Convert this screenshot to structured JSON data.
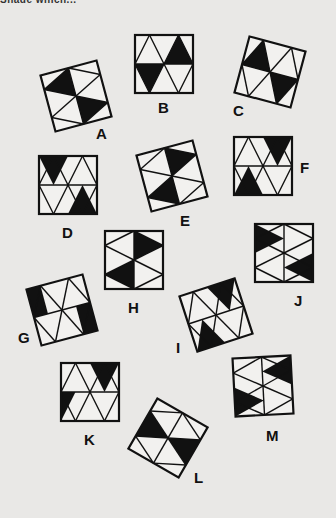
{
  "header": {
    "fragment": "Shade which..."
  },
  "style": {
    "ink": "#111111",
    "paper": "#e9e8e6",
    "stroke_width": 2.2,
    "inner_stroke_width": 1.4
  },
  "patterns": {
    "H": {
      "lines": [
        [
          0,
          0.5,
          1,
          0.5
        ],
        [
          0,
          0.5,
          0.25,
          0
        ],
        [
          0.25,
          0,
          0.5,
          0.5
        ],
        [
          0.5,
          0.5,
          0.75,
          0
        ],
        [
          0.75,
          0,
          1,
          0.5
        ],
        [
          0,
          0.5,
          0.25,
          1
        ],
        [
          0.25,
          1,
          0.5,
          0.5
        ],
        [
          0.5,
          0.5,
          0.75,
          1
        ],
        [
          0.75,
          1,
          1,
          0.5
        ]
      ]
    },
    "V": {
      "lines": [
        [
          0.5,
          0,
          0.5,
          1
        ],
        [
          0.5,
          0,
          0,
          0.25
        ],
        [
          0,
          0.25,
          0.5,
          0.5
        ],
        [
          0.5,
          0.5,
          0,
          0.75
        ],
        [
          0,
          0.75,
          0.5,
          1
        ],
        [
          0.5,
          0,
          1,
          0.25
        ],
        [
          1,
          0.25,
          0.5,
          0.5
        ],
        [
          0.5,
          0.5,
          1,
          0.75
        ],
        [
          1,
          0.75,
          0.5,
          1
        ]
      ]
    }
  },
  "figures": [
    {
      "label": "A",
      "cx": 76,
      "cy": 96,
      "size": 58,
      "rot": -15,
      "pattern": "V",
      "fills": [
        [
          [
            0.5,
            0
          ],
          [
            0,
            0.25
          ],
          [
            0.5,
            0.5
          ]
        ],
        [
          [
            0.5,
            0.5
          ],
          [
            1,
            0.75
          ],
          [
            0.5,
            1
          ]
        ]
      ],
      "label_x": 96,
      "label_y": 126
    },
    {
      "label": "B",
      "cx": 164,
      "cy": 64,
      "size": 58,
      "rot": 0,
      "pattern": "H",
      "fills": [
        [
          [
            0.5,
            0.5
          ],
          [
            0.75,
            0
          ],
          [
            1,
            0.5
          ]
        ],
        [
          [
            0,
            0.5
          ],
          [
            0.25,
            1
          ],
          [
            0.5,
            0.5
          ]
        ]
      ],
      "label_x": 158,
      "label_y": 100
    },
    {
      "label": "C",
      "cx": 270,
      "cy": 72,
      "size": 58,
      "rot": 15,
      "pattern": "H",
      "fills": [
        [
          [
            0,
            0.5
          ],
          [
            0.25,
            0
          ],
          [
            0.5,
            0.5
          ]
        ],
        [
          [
            0.5,
            0.5
          ],
          [
            0.75,
            1
          ],
          [
            1,
            0.5
          ]
        ]
      ],
      "label_x": 233,
      "label_y": 103
    },
    {
      "label": "D",
      "cx": 68,
      "cy": 185,
      "size": 58,
      "rot": 0,
      "pattern": "H",
      "fills": [
        [
          [
            0,
            0
          ],
          [
            0.5,
            0
          ],
          [
            0.25,
            0.5
          ]
        ],
        [
          [
            0.5,
            1
          ],
          [
            1,
            1
          ],
          [
            0.75,
            0.5
          ]
        ]
      ],
      "label_x": 62,
      "label_y": 225
    },
    {
      "label": "E",
      "cx": 172,
      "cy": 176,
      "size": 58,
      "rot": -15,
      "pattern": "V",
      "fills": [
        [
          [
            0.5,
            0
          ],
          [
            1,
            0.25
          ],
          [
            0.5,
            0.5
          ]
        ],
        [
          [
            0.5,
            0.5
          ],
          [
            0,
            0.75
          ],
          [
            0.5,
            1
          ]
        ]
      ],
      "label_x": 180,
      "label_y": 213
    },
    {
      "label": "F",
      "cx": 263,
      "cy": 166,
      "size": 58,
      "rot": 0,
      "pattern": "H",
      "fills": [
        [
          [
            0.5,
            0
          ],
          [
            1,
            0
          ],
          [
            0.75,
            0.5
          ]
        ],
        [
          [
            0,
            1
          ],
          [
            0.5,
            1
          ],
          [
            0.25,
            0.5
          ]
        ]
      ],
      "label_x": 300,
      "label_y": 160
    },
    {
      "label": "G",
      "cx": 62,
      "cy": 310,
      "size": 58,
      "rot": -15,
      "pattern": "H",
      "fills": [
        [
          [
            0,
            0
          ],
          [
            0.25,
            0
          ],
          [
            0.25,
            0.5
          ],
          [
            0,
            0.5
          ]
        ],
        [
          [
            0.75,
            0.5
          ],
          [
            1,
            0.5
          ],
          [
            1,
            1
          ],
          [
            0.75,
            1
          ]
        ]
      ],
      "fill_mode": "custom",
      "label_x": 18,
      "label_y": 330
    },
    {
      "label": "H",
      "cx": 134,
      "cy": 260,
      "size": 58,
      "rot": 0,
      "pattern": "V",
      "fills": [
        [
          [
            0.5,
            0
          ],
          [
            1,
            0.25
          ],
          [
            0.5,
            0.5
          ]
        ],
        [
          [
            0.5,
            0.5
          ],
          [
            0,
            0.75
          ],
          [
            0.5,
            1
          ]
        ]
      ],
      "label_x": 128,
      "label_y": 300
    },
    {
      "label": "I",
      "cx": 216,
      "cy": 315,
      "size": 58,
      "rot": -18,
      "pattern": "H",
      "fills": [
        [
          [
            0.5,
            0
          ],
          [
            1,
            0
          ],
          [
            0.75,
            0.5
          ]
        ],
        [
          [
            0,
            1
          ],
          [
            0.5,
            1
          ],
          [
            0.25,
            0.5
          ]
        ]
      ],
      "label_x": 176,
      "label_y": 340
    },
    {
      "label": "J",
      "cx": 284,
      "cy": 253,
      "size": 58,
      "rot": 0,
      "pattern": "V",
      "fills": [
        [
          [
            0,
            0
          ],
          [
            0,
            0.5
          ],
          [
            0.5,
            0.25
          ]
        ],
        [
          [
            1,
            0.5
          ],
          [
            1,
            1
          ],
          [
            0.5,
            0.75
          ]
        ]
      ],
      "label_x": 294,
      "label_y": 293
    },
    {
      "label": "K",
      "cx": 90,
      "cy": 392,
      "size": 58,
      "rot": 0,
      "pattern": "H",
      "fills": [
        [
          [
            0.5,
            0
          ],
          [
            1,
            0
          ],
          [
            0.75,
            0.5
          ]
        ],
        [
          [
            0,
            0.5
          ],
          [
            0.25,
            0.5
          ],
          [
            0,
            1
          ]
        ]
      ],
      "label_x": 84,
      "label_y": 432
    },
    {
      "label": "L",
      "cx": 168,
      "cy": 438,
      "size": 58,
      "rot": 30,
      "pattern": "V",
      "fills": [
        [
          [
            0,
            0.25
          ],
          [
            0.5,
            0.5
          ],
          [
            0,
            0.75
          ]
        ],
        [
          [
            1,
            0.25
          ],
          [
            0.5,
            0.5
          ],
          [
            1,
            0.75
          ]
        ]
      ],
      "label_x": 194,
      "label_y": 470
    },
    {
      "label": "M",
      "cx": 263,
      "cy": 386,
      "size": 58,
      "rot": -3,
      "pattern": "V",
      "fills": [
        [
          [
            1,
            0
          ],
          [
            0.5,
            0.25
          ],
          [
            1,
            0.5
          ]
        ],
        [
          [
            0,
            0.5
          ],
          [
            0.5,
            0.75
          ],
          [
            0,
            1
          ]
        ]
      ],
      "label_x": 266,
      "label_y": 428
    }
  ]
}
